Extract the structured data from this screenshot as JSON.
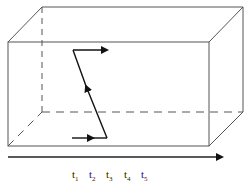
{
  "diagram": {
    "type": "3d-box-with-path",
    "box": {
      "front_face": {
        "x1": 8,
        "y1": 42,
        "x2": 209,
        "y2": 146
      },
      "depth_offset": {
        "dx": 34,
        "dy": -35
      },
      "line_color": "#555555",
      "hidden_edge_style": "dashed"
    },
    "path": {
      "color": "#111111",
      "points": [
        [
          72,
          138
        ],
        [
          107,
          138
        ],
        [
          73,
          50
        ],
        [
          107,
          50
        ]
      ],
      "arrows_at": [
        [
          93,
          138
        ],
        [
          86,
          86
        ],
        [
          107,
          50
        ]
      ]
    },
    "timeline": {
      "from_x": 8,
      "to_x": 222,
      "y": 157,
      "color": "#222222",
      "labels": [
        {
          "base": "t",
          "sub": "1",
          "x": 74
        },
        {
          "base": "t",
          "sub": "2",
          "x": 91
        },
        {
          "base": "t",
          "sub": "3",
          "x": 108
        },
        {
          "base": "t",
          "sub": "4",
          "x": 126
        },
        {
          "base": "t",
          "sub": "5",
          "x": 143
        }
      ]
    }
  }
}
